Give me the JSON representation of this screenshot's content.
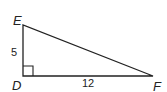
{
  "diagram": {
    "type": "right-triangle",
    "vertices": {
      "E": {
        "label": "E"
      },
      "D": {
        "label": "D",
        "right_angle": true
      },
      "F": {
        "label": "F"
      }
    },
    "sides": {
      "DE": {
        "label": "5"
      },
      "DF": {
        "label": "12"
      }
    },
    "line_color": "#222222"
  }
}
